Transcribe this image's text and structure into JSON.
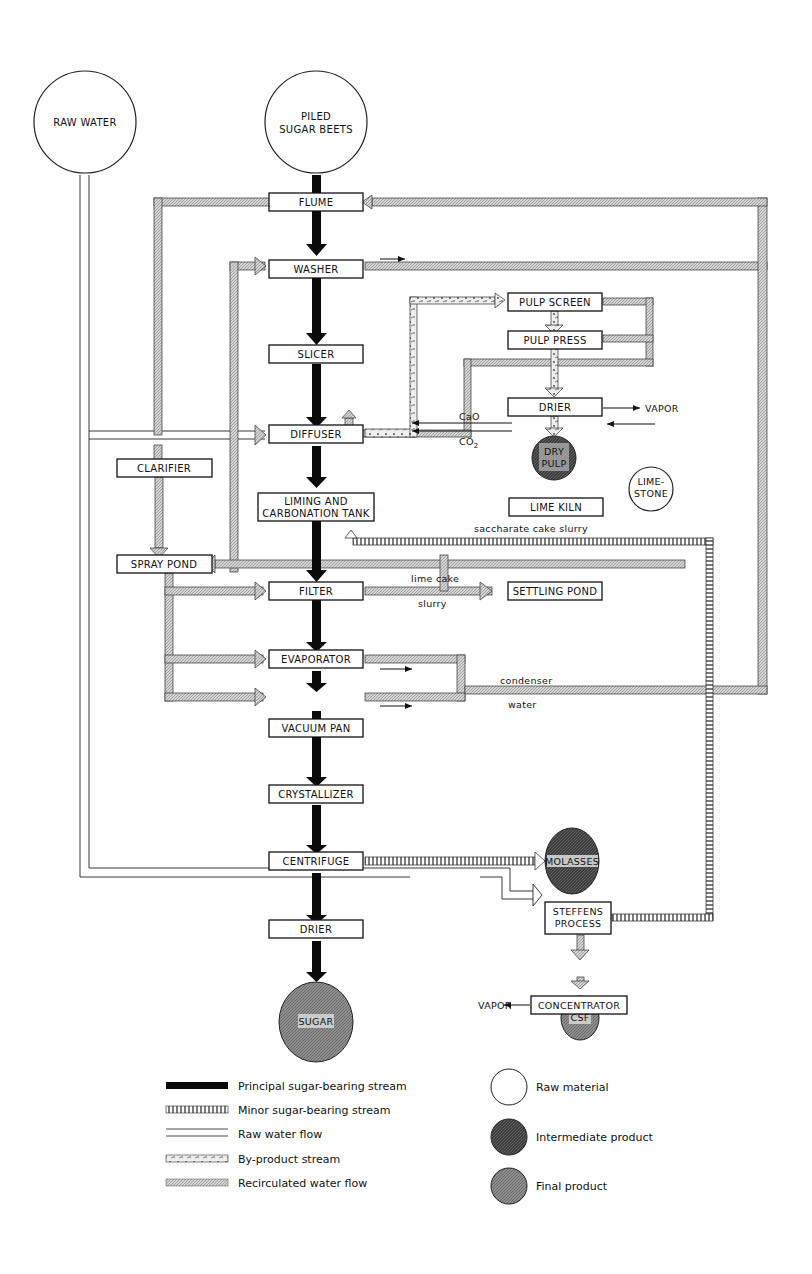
{
  "sources": {
    "raw_water": "RAW WATER",
    "beets_1": "PILED",
    "beets_2": "SUGAR BEETS",
    "limestone_1": "LIME-",
    "limestone_2": "STONE"
  },
  "units": {
    "flume": "FLUME",
    "washer": "WASHER",
    "slicer": "SLICER",
    "diffuser": "DIFFUSER",
    "clarifier": "CLARIFIER",
    "liming_1": "LIMING AND",
    "liming_2": "CARBONATION TANK",
    "spray_pond": "SPRAY POND",
    "filter": "FILTER",
    "evaporator": "EVAPORATOR",
    "vacuum_pan": "VACUUM PAN",
    "crystallizer": "CRYSTALLIZER",
    "centrifuge": "CENTRIFUGE",
    "drier_main": "DRIER",
    "pulp_screen": "PULP SCREEN",
    "pulp_press": "PULP PRESS",
    "drier_pulp": "DRIER",
    "lime_kiln": "LIME KILN",
    "settling_pond": "SETTLING POND",
    "steffens_1": "STEFFENS",
    "steffens_2": "PROCESS",
    "concentrator": "CONCENTRATOR"
  },
  "products": {
    "dry_pulp_1": "DRY",
    "dry_pulp_2": "PULP",
    "sugar": "SUGAR",
    "molasses": "MOLASSES",
    "csf": "CSF"
  },
  "stream_labels": {
    "vapor_pulp": "VAPOR",
    "vapor_conc": "VAPOR",
    "cao": "CaO",
    "co2": "CO",
    "co2_sub": "2",
    "saccharate": "saccharate cake slurry",
    "lime_cake": "lime cake",
    "slurry": "slurry",
    "condenser": "condenser",
    "water": "water"
  },
  "legend": {
    "lines": [
      {
        "label": "Principal sugar-bearing stream"
      },
      {
        "label": "Minor sugar-bearing stream"
      },
      {
        "label": "Raw water flow"
      },
      {
        "label": "By-product stream"
      },
      {
        "label": "Recirculated water flow"
      }
    ],
    "circles": [
      {
        "label": "Raw material"
      },
      {
        "label": "Intermediate product"
      },
      {
        "label": "Final product"
      }
    ]
  },
  "colors": {
    "principal": "#0a0a0a",
    "recirc_fill": "#c8c8c8",
    "intermediate": "#4a4a4a",
    "final": "#8a8a8a"
  }
}
